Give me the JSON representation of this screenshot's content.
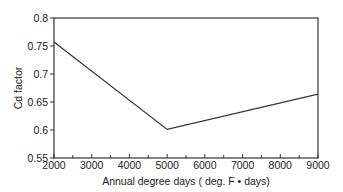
{
  "chart_data": {
    "type": "line",
    "title": "",
    "xlabel": "Annual degree days ( deg. F • days)",
    "ylabel": "Cd  factor",
    "x": [
      2000,
      5000,
      9000
    ],
    "series": [
      {
        "name": "Cd factor",
        "values": [
          0.757,
          0.601,
          0.664
        ]
      }
    ],
    "xlim": [
      2000,
      9000
    ],
    "ylim": [
      0.55,
      0.8
    ],
    "xticks": [
      "2000",
      "3000",
      "4000",
      "5000",
      "6000",
      "7000",
      "8000",
      "9000"
    ],
    "yticks": [
      "0.55",
      "0.6",
      "0.65",
      "0.7",
      "0.75",
      "0.8"
    ],
    "grid": false,
    "legend": null
  }
}
